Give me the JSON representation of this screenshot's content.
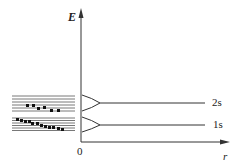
{
  "diagram": {
    "axes": {
      "y_label": "E",
      "x_label": "r",
      "origin_label": "0"
    },
    "levels": [
      {
        "name": "2s",
        "y": 103
      },
      {
        "name": "1s",
        "y": 125
      }
    ],
    "bands": [
      {
        "name": "upper-band",
        "y_top": 95,
        "y_bottom": 113,
        "line_count": 6
      },
      {
        "name": "lower-band",
        "y_top": 117,
        "y_bottom": 131,
        "line_count": 6
      }
    ],
    "colors": {
      "line": "#333333",
      "band": "#666666",
      "dot": "#111111"
    }
  }
}
